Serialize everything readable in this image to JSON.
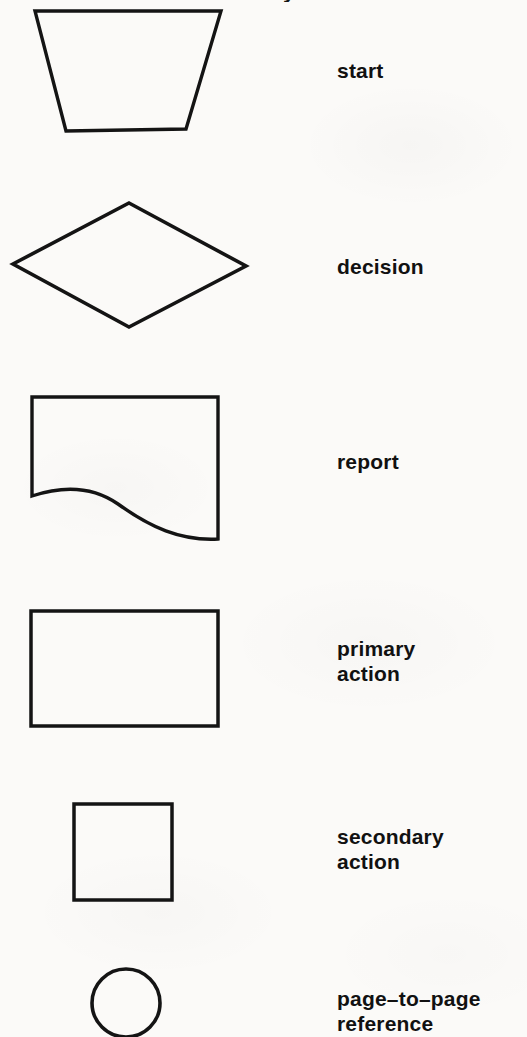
{
  "page": {
    "width": 527,
    "height": 1037,
    "background_color": "#fbfaf8",
    "ink_color": "#111111",
    "clipped_heading_text": "flowchart symbols"
  },
  "legend": {
    "title": "Flowchart symbol legend",
    "rows": [
      {
        "id": "start",
        "label": "start",
        "shape": "trapezoid",
        "shape_name": "trapezoid-shape",
        "label_x": 337,
        "label_y": 58
      },
      {
        "id": "decision",
        "label": "decision",
        "shape": "diamond",
        "shape_name": "diamond-shape",
        "label_x": 337,
        "label_y": 254
      },
      {
        "id": "report",
        "label": "report",
        "shape": "wavy-bottom-rectangle",
        "shape_name": "report-shape",
        "label_x": 337,
        "label_y": 449
      },
      {
        "id": "primary-action",
        "label": "primary\naction",
        "shape": "rectangle",
        "shape_name": "rectangle-shape",
        "label_x": 337,
        "label_y": 636
      },
      {
        "id": "secondary-action",
        "label": "secondary\naction",
        "shape": "square",
        "shape_name": "square-shape",
        "label_x": 337,
        "label_y": 824
      },
      {
        "id": "page-to-page-reference",
        "label": "page–to–page\nreference",
        "shape": "circle",
        "shape_name": "circle-shape",
        "label_x": 337,
        "label_y": 986
      }
    ]
  }
}
